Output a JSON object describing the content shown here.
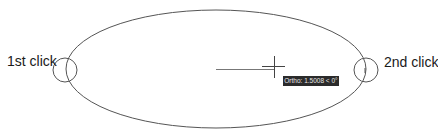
{
  "labels": {
    "first_click": "1st click",
    "second_click": "2nd click"
  },
  "tooltip": {
    "text": "Ortho: 1.5008 < 0°"
  },
  "icons": {
    "crosshair": "crosshair-cursor-icon",
    "first_point_marker": "circle-marker-icon",
    "second_point_marker": "circle-marker-icon"
  },
  "colors": {
    "stroke": "#555555",
    "tooltip_bg": "#2b2b2b",
    "tooltip_text": "#e8e8e8",
    "label_text": "#1a1a1a"
  }
}
